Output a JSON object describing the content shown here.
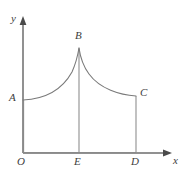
{
  "figure": {
    "background_color": "#ffffff",
    "stroke_color": "#7a7a7a",
    "axis_color": "#6d6d6d",
    "label_color": "#3d3d3d",
    "axes": {
      "x_label": "x",
      "y_label": "y",
      "origin_label": "O",
      "x_axis_has_arrow": true,
      "y_axis_has_arrow": true
    },
    "points": [
      {
        "name": "O",
        "label": "O",
        "x": 23,
        "y": 153,
        "role": "origin"
      },
      {
        "name": "A",
        "label": "A",
        "x": 23,
        "y": 100,
        "role": "curve-left-endpoint-on-y-axis"
      },
      {
        "name": "B",
        "label": "B",
        "x": 79,
        "y": 48,
        "role": "cusp-apex"
      },
      {
        "name": "C",
        "label": "C",
        "x": 136,
        "y": 96,
        "role": "curve-right-endpoint"
      },
      {
        "name": "D",
        "label": "D",
        "x": 136,
        "y": 153,
        "role": "foot-of-C-on-x-axis"
      },
      {
        "name": "E",
        "label": "E",
        "x": 79,
        "y": 153,
        "role": "foot-of-B-on-x-axis"
      }
    ],
    "segments": [
      {
        "name": "AO",
        "from": "A",
        "to": "O",
        "kind": "straight"
      },
      {
        "name": "OD",
        "from": "O",
        "to": "D",
        "kind": "straight-on-x-axis"
      },
      {
        "name": "DC",
        "from": "D",
        "to": "C",
        "kind": "straight-vertical"
      },
      {
        "name": "BE",
        "from": "B",
        "to": "E",
        "kind": "straight-vertical-divider"
      },
      {
        "name": "AB",
        "from": "A",
        "to": "B",
        "kind": "curve-concave-up-rising"
      },
      {
        "name": "BC",
        "from": "B",
        "to": "C",
        "kind": "curve-convex-falling"
      }
    ],
    "curve_paths": {
      "left_branch": "M 23,100 C 45,99 62,90 72,72 C 76,63 78,54 79,48",
      "right_branch": "M 79,48 C 80,55 83,66 89,74 C 100,89 120,95 136,96"
    }
  }
}
